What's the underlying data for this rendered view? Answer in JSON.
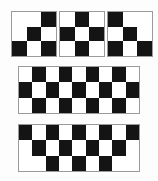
{
  "figure": {
    "background_color": "#fdfdfd",
    "dark_color": "#141414",
    "light_color": "#ffffff",
    "border_color": "#9a9a9a"
  },
  "boards": [
    {
      "name": "small-board-left",
      "rows": 3,
      "cols": 3,
      "x": 11,
      "y": 11,
      "width": 46,
      "height": 46,
      "cells": [
        [
          "w",
          "w",
          "b"
        ],
        [
          "w",
          "b",
          "w"
        ],
        [
          "b",
          "w",
          "b"
        ]
      ]
    },
    {
      "name": "small-board-center",
      "rows": 3,
      "cols": 3,
      "x": 59,
      "y": 11,
      "width": 46,
      "height": 46,
      "cells": [
        [
          "w",
          "b",
          "w"
        ],
        [
          "b",
          "w",
          "b"
        ],
        [
          "w",
          "b",
          "w"
        ]
      ]
    },
    {
      "name": "small-board-right",
      "rows": 3,
      "cols": 3,
      "x": 107,
      "y": 11,
      "width": 46,
      "height": 46,
      "cells": [
        [
          "b",
          "w",
          "w"
        ],
        [
          "w",
          "b",
          "w"
        ],
        [
          "b",
          "w",
          "b"
        ]
      ]
    },
    {
      "name": "wide-board-middle",
      "rows": 3,
      "cols": 9,
      "x": 18,
      "y": 66,
      "width": 122,
      "height": 48,
      "cells": [
        [
          "w",
          "b",
          "w",
          "b",
          "w",
          "b",
          "w",
          "b",
          "w"
        ],
        [
          "b",
          "w",
          "b",
          "w",
          "b",
          "w",
          "b",
          "w",
          "b"
        ],
        [
          "w",
          "b",
          "w",
          "b",
          "w",
          "b",
          "w",
          "b",
          "w"
        ]
      ]
    },
    {
      "name": "wide-board-bottom",
      "rows": 3,
      "cols": 9,
      "x": 18,
      "y": 124,
      "width": 122,
      "height": 48,
      "cells": [
        [
          "b",
          "w",
          "b",
          "w",
          "b",
          "w",
          "b",
          "w",
          "b"
        ],
        [
          "w",
          "b",
          "w",
          "b",
          "w",
          "b",
          "w",
          "b",
          "w"
        ],
        [
          "w",
          "w",
          "b",
          "w",
          "b",
          "w",
          "b",
          "w",
          "w"
        ]
      ]
    }
  ]
}
